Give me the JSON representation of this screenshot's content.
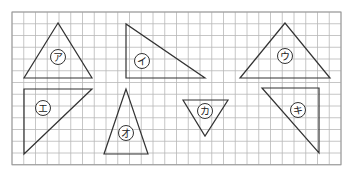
{
  "grid": {
    "origin_x": 12,
    "origin_y": 12,
    "cell": 11.75,
    "cols": 28,
    "rows": 13,
    "line_color": "#b8b8b8"
  },
  "triangles": [
    {
      "label": "ア",
      "points": [
        [
          58,
          23
        ],
        [
          24,
          78
        ],
        [
          92,
          78
        ]
      ],
      "label_pos": [
        58,
        57
      ]
    },
    {
      "label": "イ",
      "points": [
        [
          126,
          24
        ],
        [
          126,
          78
        ],
        [
          205,
          78
        ]
      ],
      "label_pos": [
        142,
        61
      ]
    },
    {
      "label": "ウ",
      "points": [
        [
          285,
          23
        ],
        [
          240,
          78
        ],
        [
          330,
          78
        ]
      ],
      "label_pos": [
        285,
        56
      ]
    },
    {
      "label": "エ",
      "points": [
        [
          24,
          89
        ],
        [
          92,
          89
        ],
        [
          24,
          154
        ]
      ],
      "label_pos": [
        43,
        108
      ]
    },
    {
      "label": "オ",
      "points": [
        [
          126,
          89
        ],
        [
          104,
          154
        ],
        [
          148,
          154
        ]
      ],
      "label_pos": [
        126,
        133
      ]
    },
    {
      "label": "カ",
      "points": [
        [
          183,
          100
        ],
        [
          228,
          100
        ],
        [
          205,
          136
        ]
      ],
      "label_pos": [
        205,
        111
      ]
    },
    {
      "label": "キ",
      "points": [
        [
          262,
          88
        ],
        [
          319,
          88
        ],
        [
          319,
          153
        ]
      ],
      "label_pos": [
        298,
        110
      ]
    }
  ]
}
